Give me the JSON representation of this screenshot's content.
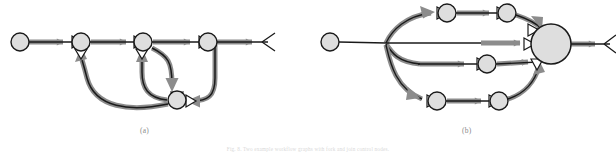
{
  "figure": {
    "width": 616,
    "height": 155,
    "background": "#ffffff",
    "caption_a": "(a)",
    "caption_b": "(b)",
    "caption_bottom": "Fig. 8.  Two example workflow graphs with fork and join control nodes."
  },
  "style": {
    "node_fill": "#dedede",
    "node_stroke": "#1a1a1a",
    "edge_stroke": "#1a1a1a",
    "arrow_fill": "#8c8c8c",
    "arrow_stroke": "#8c8c8c",
    "caption_color": "#8a8a8a",
    "node_radius": 9,
    "big_node_radius": 20,
    "edge_width": 1.6,
    "arrow_width": 5
  },
  "diagrams": [
    {
      "id": "a",
      "label": "(a)",
      "nodes": [
        {
          "id": "a-n1",
          "name": "start-node",
          "cx": 20,
          "cy": 42,
          "r": 9,
          "merge_marker": false
        },
        {
          "id": "a-n2",
          "name": "node-2",
          "cx": 81,
          "cy": 42,
          "r": 9,
          "merge_marker": true
        },
        {
          "id": "a-n3",
          "name": "node-3",
          "cx": 143,
          "cy": 42,
          "r": 9,
          "merge_marker": true
        },
        {
          "id": "a-n4",
          "name": "node-4",
          "cx": 208,
          "cy": 42,
          "r": 9,
          "merge_marker": true
        },
        {
          "id": "a-n5",
          "name": "loop-node",
          "cx": 177,
          "cy": 100,
          "r": 9,
          "merge_marker": true
        }
      ],
      "edges": [
        {
          "name": "edge-start-to-2",
          "from": "a-n1",
          "to": "a-n2",
          "kind": "straight",
          "arrow": true
        },
        {
          "name": "edge-2-to-3",
          "from": "a-n2",
          "to": "a-n3",
          "kind": "straight",
          "arrow": true
        },
        {
          "name": "edge-3-to-4",
          "from": "a-n3",
          "to": "a-n4",
          "kind": "straight",
          "arrow": true
        },
        {
          "name": "edge-4-to-end",
          "from": "a-n4",
          "to": "end",
          "kind": "straight",
          "arrow": true
        },
        {
          "name": "edge-3-down-to-loop",
          "from": "a-n3",
          "to": "a-n5",
          "kind": "curve",
          "arrow": true
        },
        {
          "name": "edge-loop-back-to-2",
          "from": "a-n5",
          "to": "a-n2",
          "kind": "curve",
          "arrow": true
        },
        {
          "name": "edge-loop-back-to-3",
          "from": "a-n5",
          "to": "a-n3",
          "kind": "curve",
          "arrow": true
        },
        {
          "name": "edge-4-down-to-loop",
          "from": "a-n4",
          "to": "a-n5",
          "kind": "curve",
          "arrow": true
        }
      ],
      "terminal": {
        "name": "end-marker-a",
        "x": 268,
        "y": 42
      }
    },
    {
      "id": "b",
      "label": "(b)",
      "nodes": [
        {
          "id": "b-n1",
          "name": "start-node",
          "cx": 330,
          "cy": 42,
          "r": 9,
          "merge_marker": false
        },
        {
          "id": "b-fork",
          "name": "fork-point",
          "cx": 385,
          "cy": 42,
          "r": 0,
          "merge_marker": false
        },
        {
          "id": "b-t1",
          "name": "top-node-1",
          "cx": 447,
          "cy": 13,
          "r": 9,
          "merge_marker": true
        },
        {
          "id": "b-t2",
          "name": "top-node-2",
          "cx": 507,
          "cy": 13,
          "r": 9,
          "merge_marker": true
        },
        {
          "id": "b-m1",
          "name": "middle-node-1",
          "cx": 487,
          "cy": 64,
          "r": 9,
          "merge_marker": true
        },
        {
          "id": "b-b1",
          "name": "bottom-node-1",
          "cx": 437,
          "cy": 101,
          "r": 9,
          "merge_marker": true
        },
        {
          "id": "b-b2",
          "name": "bottom-node-2",
          "cx": 499,
          "cy": 101,
          "r": 9,
          "merge_marker": true
        },
        {
          "id": "b-join",
          "name": "join-node-large",
          "cx": 551,
          "cy": 44,
          "r": 20,
          "merge_marker": true
        }
      ],
      "edges": [
        {
          "name": "edge-start-to-fork",
          "from": "b-n1",
          "to": "b-fork",
          "kind": "straight",
          "arrow": false
        },
        {
          "name": "edge-fork-to-top",
          "from": "b-fork",
          "to": "b-t1",
          "kind": "curve",
          "arrow": true
        },
        {
          "name": "edge-top1-to-top2",
          "from": "b-t1",
          "to": "b-t2",
          "kind": "straight",
          "arrow": true
        },
        {
          "name": "edge-top2-to-join",
          "from": "b-t2",
          "to": "b-join",
          "kind": "curve",
          "arrow": true
        },
        {
          "name": "edge-fork-to-join",
          "from": "b-fork",
          "to": "b-join",
          "kind": "straight",
          "arrow": true
        },
        {
          "name": "edge-fork-to-mid",
          "from": "b-fork",
          "to": "b-m1",
          "kind": "curve",
          "arrow": true
        },
        {
          "name": "edge-mid-to-join",
          "from": "b-m1",
          "to": "b-join",
          "kind": "straight",
          "arrow": true
        },
        {
          "name": "edge-fork-to-bottom",
          "from": "b-fork",
          "to": "b-b1",
          "kind": "curve",
          "arrow": true
        },
        {
          "name": "edge-bot1-to-bot2",
          "from": "b-b1",
          "to": "b-b2",
          "kind": "straight",
          "arrow": true
        },
        {
          "name": "edge-bot2-to-join",
          "from": "b-b2",
          "to": "b-join",
          "kind": "curve",
          "arrow": true
        },
        {
          "name": "edge-join-to-end",
          "from": "b-join",
          "to": "end",
          "kind": "straight",
          "arrow": true
        }
      ],
      "terminal": {
        "name": "end-marker-b",
        "x": 610,
        "y": 44
      }
    }
  ]
}
